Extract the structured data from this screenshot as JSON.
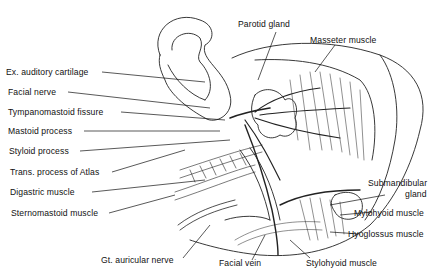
{
  "diagram": {
    "labels_left": [
      {
        "id": "ex-auditory-cartilage",
        "text": "Ex. auditory cartilage"
      },
      {
        "id": "facial-nerve",
        "text": "Facial nerve"
      },
      {
        "id": "tympanomastoid-fissure",
        "text": "Tympanomastoid fissure"
      },
      {
        "id": "mastoid-process",
        "text": "Mastoid process"
      },
      {
        "id": "styloid-process",
        "text": "Styloid process"
      },
      {
        "id": "trans-process-atlas",
        "text": "Trans. process of Atlas"
      },
      {
        "id": "digastric-muscle",
        "text": "Digastric muscle"
      },
      {
        "id": "sternomastoid-muscle",
        "text": "Sternomastoid muscle"
      }
    ],
    "labels_top": [
      {
        "id": "parotid-gland",
        "text": "Parotid gland"
      },
      {
        "id": "masseter-muscle",
        "text": "Masseter muscle"
      }
    ],
    "labels_right": [
      {
        "id": "submandibular-gland-line1",
        "text": "Submandibular"
      },
      {
        "id": "submandibular-gland-line2",
        "text": "gland"
      },
      {
        "id": "mylohyoid-muscle",
        "text": "Mylohyoid muscle"
      },
      {
        "id": "hyoglossus-muscle",
        "text": "Hyoglossus muscle"
      }
    ],
    "labels_bottom": [
      {
        "id": "gt-auricular-nerve",
        "text": "Gt. auricular nerve"
      },
      {
        "id": "facial-vein",
        "text": "Facial vein"
      },
      {
        "id": "stylohyoid-muscle",
        "text": "Stylohyoid muscle"
      }
    ]
  },
  "colors": {
    "ink": "#111111",
    "background": "#ffffff"
  }
}
